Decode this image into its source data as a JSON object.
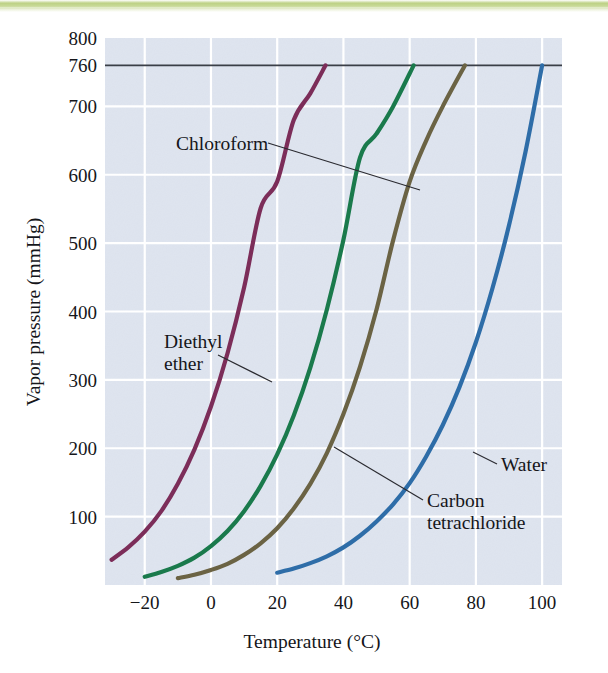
{
  "figure": {
    "background_color": "#ffffff",
    "plot_background_color": "#dfe5f0",
    "gridline_color": "#ffffff"
  },
  "chart_data": {
    "type": "line",
    "title": "",
    "xlabel": "Temperature (°C)",
    "ylabel": "Vapor pressure (mmHg)",
    "xlim": [
      -32,
      106
    ],
    "ylim": [
      0,
      800
    ],
    "xticks": [
      -20,
      0,
      20,
      40,
      60,
      80,
      100
    ],
    "xtick_labels": [
      "−20",
      "0",
      "20",
      "40",
      "60",
      "80",
      "100"
    ],
    "yticks": [
      100,
      200,
      300,
      400,
      500,
      600,
      700,
      760,
      800
    ],
    "ytick_labels": [
      "100",
      "200",
      "300",
      "400",
      "500",
      "600",
      "700",
      "760",
      "800"
    ],
    "grid": true,
    "legend": "none",
    "annotations": [
      {
        "name": "atmospheric-pressure-line",
        "kind": "horizontal-line",
        "value": 760,
        "color": "#3a3f47",
        "label": "760"
      }
    ],
    "series": [
      {
        "name": "Diethyl ether",
        "color": "#7c2d59",
        "boiling_point_c": 34.6,
        "x": [
          -30,
          -25,
          -20,
          -15,
          -10,
          -5,
          0,
          5,
          10,
          15,
          20,
          25,
          30,
          34.6
        ],
        "y": [
          37,
          55,
          78,
          108,
          148,
          198,
          261,
          339,
          435,
          551,
          590,
          680,
          719,
          760
        ]
      },
      {
        "name": "Chloroform",
        "color": "#1a7a4c",
        "boiling_point_c": 61.2,
        "x": [
          -20,
          -15,
          -10,
          -5,
          0,
          5,
          10,
          15,
          20,
          25,
          30,
          35,
          40,
          45,
          50,
          55,
          61.2
        ],
        "y": [
          12,
          19,
          28,
          40,
          57,
          79,
          108,
          145,
          191,
          248,
          318,
          403,
          505,
          625,
          660,
          700,
          760
        ]
      },
      {
        "name": "Carbon tetrachloride",
        "color": "#6b6344",
        "boiling_point_c": 76.7,
        "x": [
          -10,
          -5,
          0,
          5,
          10,
          15,
          20,
          25,
          30,
          35,
          40,
          45,
          50,
          55,
          60,
          65,
          70,
          76.7
        ],
        "y": [
          10,
          15,
          22,
          31,
          44,
          61,
          83,
          112,
          148,
          193,
          250,
          319,
          403,
          504,
          590,
          650,
          700,
          760
        ]
      },
      {
        "name": "Water",
        "color": "#2e6da8",
        "boiling_point_c": 100,
        "x": [
          20,
          25,
          30,
          35,
          40,
          45,
          50,
          55,
          60,
          65,
          70,
          75,
          80,
          85,
          90,
          95,
          100
        ],
        "y": [
          18,
          24,
          32,
          42,
          55,
          72,
          93,
          118,
          149,
          188,
          234,
          289,
          355,
          434,
          526,
          634,
          760
        ]
      }
    ]
  },
  "labels": {
    "chloroform": "Chloroform",
    "diethyl_line1": "Diethyl",
    "diethyl_line2": "ether",
    "water": "Water",
    "carbon_line1": "Carbon",
    "carbon_line2": "tetrachloride"
  },
  "axis": {
    "x_title": "Temperature (°C)",
    "y_title": "Vapor pressure (mmHg)"
  }
}
